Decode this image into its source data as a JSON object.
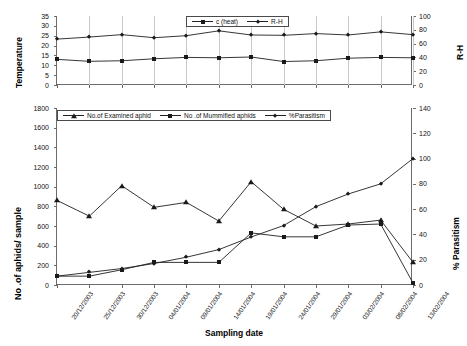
{
  "figure": {
    "x_axis_title": "Sampling date",
    "dates": [
      "20/12/2003",
      "25/12/2003",
      "30/12/2003",
      "04/01/2004",
      "09/01/2004",
      "14/01/2004",
      "19/01/2004",
      "24/01/2004",
      "29/01/2004",
      "03/02/2004",
      "08/02/2004",
      "13/02/2004"
    ]
  },
  "chart_data": [
    {
      "type": "line",
      "id": "weather",
      "title": "",
      "xlabel": "",
      "ylabel": "Temperature",
      "y2label": "R-H",
      "ylim": [
        0,
        35
      ],
      "yticks": [
        0,
        5,
        10,
        15,
        20,
        25,
        30,
        35
      ],
      "y2lim": [
        0,
        100
      ],
      "y2ticks": [
        0,
        20,
        40,
        60,
        80,
        100
      ],
      "grid": false,
      "legend_position": "top-center",
      "categories": [
        "20/12/2003",
        "25/12/2003",
        "30/12/2003",
        "04/01/2004",
        "09/01/2004",
        "14/01/2004",
        "19/01/2004",
        "24/01/2004",
        "29/01/2004",
        "03/02/2004",
        "08/02/2004",
        "13/02/2004"
      ],
      "series": [
        {
          "name": "c  (heat)",
          "marker": "square",
          "axis": "left",
          "values": [
            13.0,
            12.0,
            12.3,
            13.3,
            14.0,
            13.8,
            14.2,
            11.9,
            12.3,
            13.6,
            14.0,
            13.8
          ]
        },
        {
          "name": "R-H",
          "marker": "diamond",
          "axis": "right",
          "values": [
            66.5,
            69.5,
            73.0,
            68.5,
            71.5,
            78.5,
            72.5,
            72.0,
            74.5,
            72.5,
            77.0,
            73.0
          ]
        }
      ]
    },
    {
      "type": "line",
      "id": "aphids",
      "title": "",
      "xlabel": "Sampling date",
      "ylabel": "No .of aphids/ sample",
      "y2label": "% Parasitism",
      "ylim": [
        0,
        1800
      ],
      "yticks": [
        0,
        200,
        400,
        600,
        800,
        1000,
        1200,
        1400,
        1600,
        1800
      ],
      "y2lim": [
        0,
        140
      ],
      "y2ticks": [
        0,
        20,
        40,
        60,
        80,
        100,
        120,
        140
      ],
      "grid": false,
      "legend_position": "top-center",
      "categories": [
        "20/12/2003",
        "25/12/2003",
        "30/12/2003",
        "04/01/2004",
        "09/01/2004",
        "14/01/2004",
        "19/01/2004",
        "24/01/2004",
        "29/01/2004",
        "03/02/2004",
        "08/02/2004",
        "13/02/2004"
      ],
      "series": [
        {
          "name": "No.of Examined aphid",
          "marker": "triangle",
          "axis": "left",
          "values": [
            860,
            700,
            1010,
            790,
            840,
            650,
            1050,
            770,
            600,
            620,
            660,
            230
          ]
        },
        {
          "name": "No .of Mummified aphids",
          "marker": "square",
          "axis": "left",
          "values": [
            90,
            90,
            155,
            230,
            230,
            230,
            530,
            490,
            490,
            610,
            620,
            20
          ]
        },
        {
          "name": "%Parasitism",
          "marker": "diamond",
          "axis": "right",
          "values": [
            7,
            10,
            13,
            17,
            22,
            28,
            38,
            47,
            62,
            72,
            80,
            100
          ]
        }
      ]
    }
  ]
}
